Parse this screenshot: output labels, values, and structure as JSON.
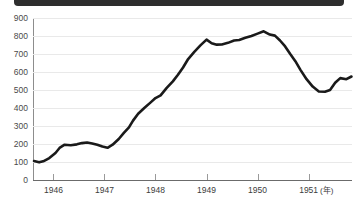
{
  "banner": {
    "visible": true,
    "color": "#2e2e2e"
  },
  "chart_data": {
    "type": "line",
    "title": "",
    "xlabel": "(年)",
    "ylabel": "",
    "ylim": [
      0,
      900
    ],
    "xlim": [
      1945.6,
      1951.85
    ],
    "grid": true,
    "legend": "none",
    "line_color": "#1a1a1a",
    "y_ticks": [
      900,
      800,
      700,
      600,
      500,
      400,
      300,
      200,
      100,
      0
    ],
    "x_ticks": [
      1946,
      1947,
      1948,
      1949,
      1950,
      1951
    ],
    "x_tick_labels": [
      "1946",
      "1947",
      "1948",
      "1949",
      "1950",
      "1951"
    ],
    "series": [
      {
        "name": "value",
        "x": [
          1945.62,
          1945.72,
          1945.8,
          1945.92,
          1946.04,
          1946.12,
          1946.22,
          1946.34,
          1946.46,
          1946.56,
          1946.66,
          1946.76,
          1946.86,
          1946.96,
          1947.06,
          1947.16,
          1947.28,
          1947.38,
          1947.48,
          1947.56,
          1947.66,
          1947.78,
          1947.9,
          1948.0,
          1948.1,
          1948.22,
          1948.34,
          1948.44,
          1948.54,
          1948.64,
          1948.76,
          1948.88,
          1949.0,
          1949.1,
          1949.2,
          1949.3,
          1949.42,
          1949.54,
          1949.64,
          1949.76,
          1949.88,
          1950.0,
          1950.12,
          1950.24,
          1950.34,
          1950.44,
          1950.54,
          1950.64,
          1950.74,
          1950.84,
          1950.96,
          1951.08,
          1951.2,
          1951.32,
          1951.42,
          1951.52,
          1951.62,
          1951.74,
          1951.84
        ],
        "values": [
          105,
          98,
          104,
          122,
          150,
          178,
          196,
          193,
          198,
          205,
          208,
          203,
          196,
          186,
          179,
          196,
          228,
          262,
          292,
          330,
          368,
          400,
          430,
          455,
          470,
          512,
          548,
          585,
          625,
          672,
          712,
          748,
          780,
          760,
          752,
          753,
          762,
          775,
          778,
          790,
          800,
          813,
          826,
          808,
          802,
          775,
          742,
          700,
          660,
          612,
          560,
          519,
          492,
          490,
          500,
          540,
          566,
          560,
          575
        ]
      }
    ],
    "annotations": []
  }
}
